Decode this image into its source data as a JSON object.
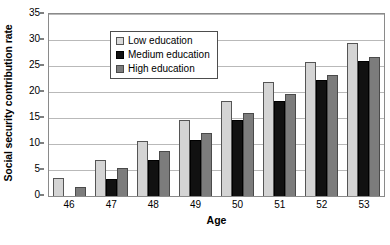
{
  "chart_data": {
    "type": "bar",
    "title": "",
    "xlabel": "Age",
    "ylabel": "Social security contribution rate",
    "categories": [
      "46",
      "47",
      "48",
      "49",
      "50",
      "51",
      "52",
      "53"
    ],
    "series": [
      {
        "name": "Low education",
        "values": [
          3.5,
          7.0,
          10.6,
          14.7,
          18.3,
          22.0,
          25.8,
          29.4
        ]
      },
      {
        "name": "Medium education",
        "values": [
          0.0,
          3.3,
          6.9,
          10.7,
          14.6,
          18.2,
          22.4,
          26.0
        ]
      },
      {
        "name": "High education",
        "values": [
          1.7,
          5.3,
          8.7,
          12.2,
          16.0,
          19.6,
          23.2,
          26.7
        ]
      }
    ],
    "ylim": [
      0,
      35
    ],
    "yticks": [
      0,
      5,
      10,
      15,
      20,
      25,
      30,
      35
    ],
    "grid": true,
    "legend_position": "top-left",
    "colors": {
      "low": "#d4d4d4",
      "medium": "#111111",
      "high": "#7c7c7c",
      "gridline": "#b9b9b9",
      "axis": "#8a8a8a",
      "text": "#000000"
    }
  }
}
